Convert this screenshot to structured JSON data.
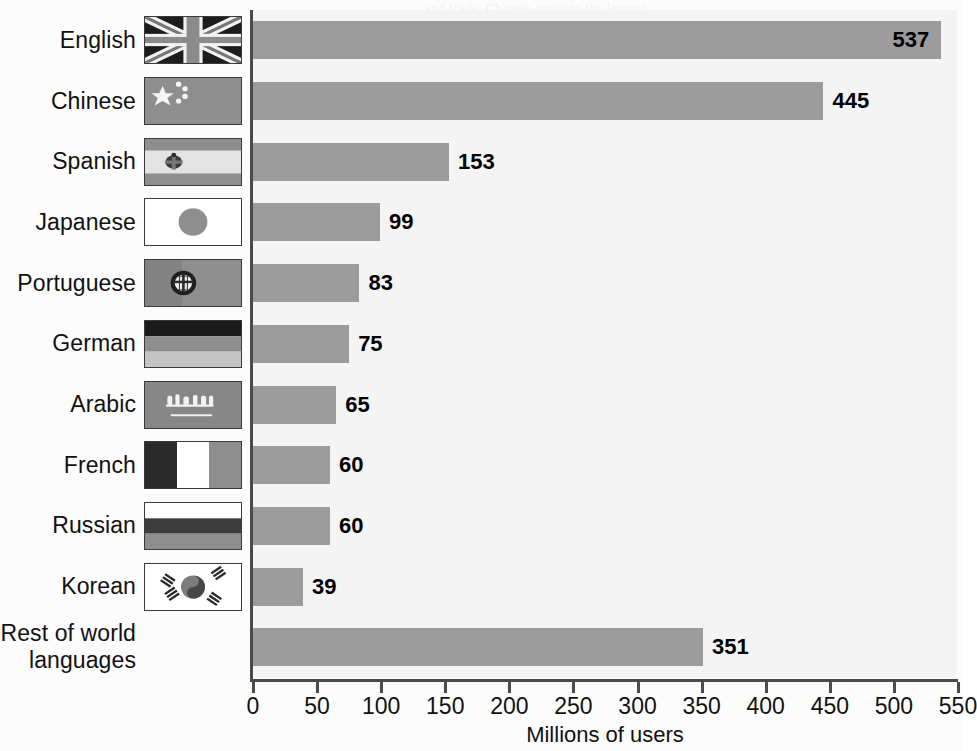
{
  "chart_data": {
    "type": "bar",
    "orientation": "horizontal",
    "title": "",
    "xlabel": "Millions of users",
    "ylabel": "",
    "xlim": [
      0,
      550
    ],
    "xticks": [
      0,
      50,
      100,
      150,
      200,
      250,
      300,
      350,
      400,
      450,
      500,
      550
    ],
    "xtick_labels": [
      "0",
      "50",
      "100",
      "150",
      "200",
      "250",
      "300",
      "350",
      "400",
      "450",
      "500",
      "550"
    ],
    "grid": false,
    "legend": null,
    "categories": [
      "English",
      "Chinese",
      "Spanish",
      "Japanese",
      "Portuguese",
      "German",
      "Arabic",
      "French",
      "Russian",
      "Korean",
      "Rest of world\nlanguages"
    ],
    "values": [
      537,
      445,
      153,
      99,
      83,
      75,
      65,
      60,
      60,
      39,
      351
    ],
    "value_labels": [
      "537",
      "445",
      "153",
      "99",
      "83",
      "75",
      "65",
      "60",
      "60",
      "39",
      "351"
    ],
    "label_placement": [
      "inside",
      "outside",
      "outside",
      "outside",
      "outside",
      "outside",
      "outside",
      "outside",
      "outside",
      "outside",
      "outside"
    ],
    "flags": [
      "uk-flag-icon",
      "china-flag-icon",
      "spain-flag-icon",
      "japan-flag-icon",
      "portugal-flag-icon",
      "germany-flag-icon",
      "saudi-arabia-flag-icon",
      "france-flag-icon",
      "russia-flag-icon",
      "south-korea-flag-icon",
      "no-flag"
    ],
    "colors": {
      "bar_fill": "#9c9c9c",
      "plot_background": "#f4f4f4",
      "page_background": "#fcfcfc",
      "axis": "#4a4a4a",
      "text": "#111111"
    }
  },
  "axis": {
    "x_title": "Millions of users"
  }
}
